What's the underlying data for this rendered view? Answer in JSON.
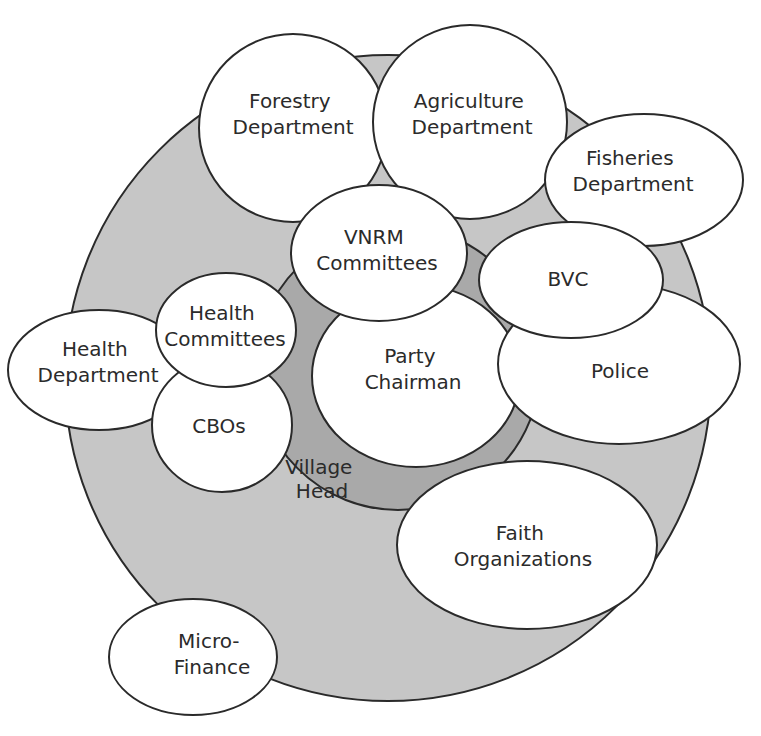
{
  "caption": {
    "text": "",
    "note": "clipped caption line at top edge; only descenders visible"
  },
  "colors": {
    "outer_ring": "#c6c6c6",
    "inner_ring": "#a9a9a9",
    "node_fill": "#ffffff",
    "stroke": "#2a2a2a",
    "text": "#2b2b2b"
  },
  "rings": {
    "outer": {
      "label": ""
    },
    "inner": {
      "label_line1": "Village",
      "label_line2": "Head"
    }
  },
  "nodes": {
    "forestry": {
      "line1": "Forestry",
      "line2": "Department"
    },
    "agriculture": {
      "line1": "Agriculture",
      "line2": "Department"
    },
    "fisheries": {
      "line1": "Fisheries",
      "line2": "Department"
    },
    "vnrm": {
      "line1": "VNRM",
      "line2": "Committees"
    },
    "bvc": {
      "line1": "BVC"
    },
    "police": {
      "line1": "Police"
    },
    "party_chairman": {
      "line1": "Party",
      "line2": "Chairman"
    },
    "health_committees": {
      "line1": "Health",
      "line2": "Committees"
    },
    "health_department": {
      "line1": "Health",
      "line2": "Department"
    },
    "cbos": {
      "line1": "CBOs"
    },
    "faith": {
      "line1": "Faith",
      "line2": "Organizations"
    },
    "microfinance": {
      "line1": "Micro-",
      "line2": "Finance"
    }
  }
}
